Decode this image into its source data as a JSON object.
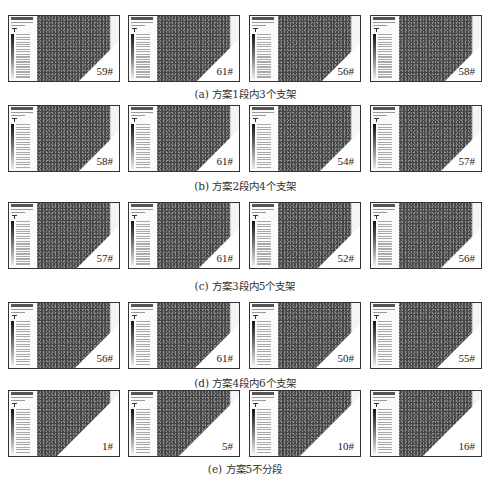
{
  "figure": {
    "rows": [
      {
        "caption": "(a) 方案1段内3个支架",
        "panels": [
          {
            "label": "59#"
          },
          {
            "label": "61#"
          },
          {
            "label": "56#"
          },
          {
            "label": "58#"
          }
        ]
      },
      {
        "caption": "(b) 方案2段内4个支架",
        "panels": [
          {
            "label": "58#"
          },
          {
            "label": "61#"
          },
          {
            "label": "54#"
          },
          {
            "label": "57#"
          }
        ]
      },
      {
        "caption": "(c) 方案3段内5个支架",
        "panels": [
          {
            "label": "57#"
          },
          {
            "label": "61#"
          },
          {
            "label": "52#"
          },
          {
            "label": "56#"
          }
        ]
      },
      {
        "caption": "(d) 方案4段内6个支架",
        "panels": [
          {
            "label": "56#"
          },
          {
            "label": "61#"
          },
          {
            "label": "50#"
          },
          {
            "label": "55#"
          }
        ]
      },
      {
        "caption": "(e) 方案5不分段",
        "panels": [
          {
            "label": "1#"
          },
          {
            "label": "5#"
          },
          {
            "label": "10#"
          },
          {
            "label": "16#"
          }
        ]
      }
    ]
  }
}
